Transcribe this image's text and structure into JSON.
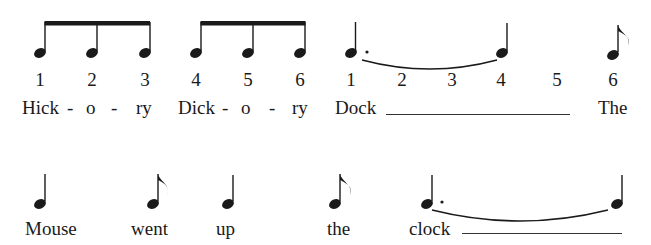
{
  "colors": {
    "ink": "#1a1a1a",
    "background": "#ffffff"
  },
  "row1": {
    "counts": [
      {
        "label": "1",
        "x": 40
      },
      {
        "label": "2",
        "x": 92
      },
      {
        "label": "3",
        "x": 145
      },
      {
        "label": "4",
        "x": 196
      },
      {
        "label": "5",
        "x": 248
      },
      {
        "label": "6",
        "x": 300
      },
      {
        "label": "1",
        "x": 351
      },
      {
        "label": "2",
        "x": 402
      },
      {
        "label": "3",
        "x": 452
      },
      {
        "label": "4",
        "x": 501
      },
      {
        "label": "5",
        "x": 557
      },
      {
        "label": "6",
        "x": 613
      }
    ],
    "lyrics": [
      {
        "text": "Hick",
        "x": 22
      },
      {
        "text": "-",
        "x": 67
      },
      {
        "text": "o",
        "x": 86
      },
      {
        "text": "-",
        "x": 111
      },
      {
        "text": "ry",
        "x": 136
      },
      {
        "text": "Dick",
        "x": 178
      },
      {
        "text": "-",
        "x": 222
      },
      {
        "text": "o",
        "x": 241
      },
      {
        "text": "-",
        "x": 269
      },
      {
        "text": "ry",
        "x": 292
      },
      {
        "text": "Dock",
        "x": 335
      },
      {
        "text": "The",
        "x": 598
      }
    ]
  },
  "row2": {
    "lyrics": [
      {
        "text": "Mouse",
        "x": 25
      },
      {
        "text": "went",
        "x": 131
      },
      {
        "text": "up",
        "x": 216
      },
      {
        "text": "the",
        "x": 327
      },
      {
        "text": "clock",
        "x": 409
      }
    ]
  },
  "notes": {
    "row1": [
      {
        "type": "eighth-beamed",
        "x": 40
      },
      {
        "type": "eighth-beamed",
        "x": 92
      },
      {
        "type": "eighth-beamed",
        "x": 145
      },
      {
        "type": "eighth-beamed",
        "x": 196
      },
      {
        "type": "eighth-beamed",
        "x": 248
      },
      {
        "type": "eighth-beamed",
        "x": 300
      },
      {
        "type": "dotted-quarter",
        "x": 351
      },
      {
        "type": "quarter",
        "x": 502
      },
      {
        "type": "eighth",
        "x": 613
      }
    ],
    "row2": [
      {
        "type": "quarter",
        "x": 40
      },
      {
        "type": "eighth",
        "x": 153
      },
      {
        "type": "quarter",
        "x": 228
      },
      {
        "type": "eighth",
        "x": 335
      },
      {
        "type": "dotted-quarter",
        "x": 425
      },
      {
        "type": "quarter",
        "x": 612
      }
    ]
  }
}
